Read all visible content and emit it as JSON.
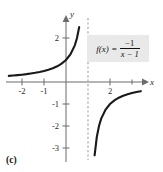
{
  "caption": "(c)",
  "colors": {
    "curve": "#1a1a1a",
    "axis": "#6b6b6b",
    "asymptote": "#b5b5b5",
    "formula_background": "#e9e9e9",
    "page_background": "#ffffff"
  },
  "formula": {
    "lhs": "f(x)",
    "equals": "=",
    "numerator": "−1",
    "denominator": "x − 1",
    "plain": "f(x) = -1/(x - 1)"
  },
  "axes": {
    "x_name": "x",
    "y_name": "y",
    "x_ticklabels": [
      "-2",
      "-1",
      "2"
    ],
    "y_ticklabels": [
      "2",
      "-1",
      "-2",
      "-3"
    ]
  },
  "chart_data": {
    "type": "line",
    "title": "",
    "subtitle": "",
    "xlabel": "x",
    "ylabel": "y",
    "xlim": [
      -2.6,
      3.5
    ],
    "ylim": [
      -3.6,
      2.7
    ],
    "grid": false,
    "legend": null,
    "annotations": [
      {
        "text": "f(x) = -1/(x - 1)",
        "x": 2.0,
        "y": 2.0,
        "style": "boxed-label"
      },
      {
        "text": "(c)",
        "position": "below-plot",
        "style": "figure-caption"
      }
    ],
    "x_ticks": [
      -2,
      -1,
      2
    ],
    "x_tick_labels": [
      "-2",
      "-1",
      "2"
    ],
    "x_minor_ticks": [
      3
    ],
    "y_ticks": [
      2,
      -1,
      -2,
      -3
    ],
    "y_tick_labels": [
      "2",
      "-1",
      "-2",
      "-3"
    ],
    "asymptotes": [
      {
        "type": "vertical",
        "value": 1,
        "style": "dashed",
        "label": ""
      },
      {
        "type": "horizontal",
        "value": 0,
        "style": "implicit",
        "label": ""
      }
    ],
    "series": [
      {
        "name": "f(x) = -1/(x - 1) left branch",
        "domain": [
          -2.6,
          0.93
        ],
        "x": [
          -2.6,
          -2.4,
          -2.2,
          -2.0,
          -1.8,
          -1.6,
          -1.4,
          -1.2,
          -1.0,
          -0.8,
          -0.6,
          -0.4,
          -0.2,
          0.0,
          0.2,
          0.4,
          0.5,
          0.6,
          0.7,
          0.75,
          0.8,
          0.85,
          0.88,
          0.9,
          0.92,
          0.93
        ],
        "y": [
          0.278,
          0.294,
          0.313,
          0.333,
          0.357,
          0.385,
          0.417,
          0.455,
          0.5,
          0.556,
          0.625,
          0.714,
          0.833,
          1.0,
          1.25,
          1.667,
          2.0,
          2.5,
          3.333,
          4.0,
          5.0,
          6.667,
          8.333,
          10.0,
          12.5,
          14.286
        ]
      },
      {
        "name": "f(x) = -1/(x - 1) right branch",
        "domain": [
          1.07,
          3.4
        ],
        "x": [
          1.07,
          1.08,
          1.1,
          1.12,
          1.15,
          1.2,
          1.25,
          1.3,
          1.4,
          1.5,
          1.6,
          1.8,
          2.0,
          2.2,
          2.4,
          2.6,
          2.8,
          3.0,
          3.2,
          3.4
        ],
        "y": [
          -14.286,
          -12.5,
          -10.0,
          -8.333,
          -6.667,
          -5.0,
          -4.0,
          -3.333,
          -2.5,
          -2.0,
          -1.667,
          -1.25,
          -1.0,
          -0.833,
          -0.714,
          -0.625,
          -0.556,
          -0.5,
          -0.455,
          -0.417
        ]
      }
    ]
  }
}
